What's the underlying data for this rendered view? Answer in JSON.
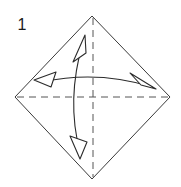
{
  "figure": {
    "kind": "origami-fold-diagram",
    "step_number": "1",
    "background_color": "#ffffff",
    "ink_color": "#3a3a3a",
    "crease_color": "#555555",
    "arrow_color": "#2b2b2b"
  },
  "shape": {
    "name": "square-rotated-45-diamond",
    "vertices": {
      "top": {
        "x": 92,
        "y": 16
      },
      "right": {
        "x": 170,
        "y": 97
      },
      "bottom": {
        "x": 92,
        "y": 179
      },
      "left": {
        "x": 15,
        "y": 97
      }
    },
    "outline_style": "solid",
    "outline_width": 1
  },
  "creases": [
    {
      "name": "vertical-crease",
      "style": "dashed",
      "from": {
        "x": 93,
        "y": 18
      },
      "to": {
        "x": 93,
        "y": 177
      },
      "dash_pattern": "7 5"
    },
    {
      "name": "horizontal-crease",
      "style": "dashed",
      "from": {
        "x": 17,
        "y": 97
      },
      "to": {
        "x": 168,
        "y": 97
      },
      "dash_pattern": "7 5"
    }
  ],
  "arrows": [
    {
      "name": "horizontal-fold-arrow",
      "orientation": "horizontal",
      "curve": "arc-bowing-up",
      "path": "M 43 82 Q 97 70 152 87",
      "start_head": {
        "type": "hollow-triangle",
        "points": "34,80 55,73 51,87",
        "direction": "left"
      },
      "end_head": {
        "type": "thin-open-arrow",
        "points": "155,88 131,74 141,86",
        "direction": "right"
      }
    },
    {
      "name": "vertical-fold-arrow",
      "orientation": "vertical",
      "curve": "arc-bowing-left",
      "path": "M 83 42 Q 66 100 80 152",
      "start_head": {
        "type": "thin-open-arrow",
        "points": "84,36 74,61 85,52",
        "direction": "up"
      },
      "end_head": {
        "type": "hollow-triangle",
        "points": "80,158 71,137 86,141",
        "direction": "down"
      }
    }
  ],
  "labels": {
    "step_number": {
      "text": "1",
      "x": 22,
      "y": 30
    }
  }
}
